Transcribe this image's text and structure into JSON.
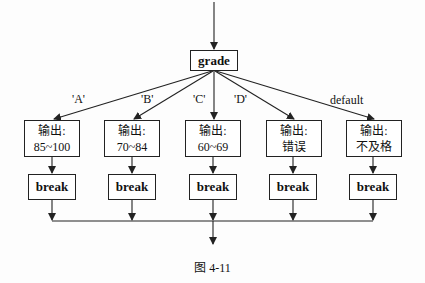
{
  "diagram": {
    "switch_node": "grade",
    "cases": [
      {
        "label": "'A'",
        "output_prefix": "输出:",
        "output_value": "85~100",
        "action": "break"
      },
      {
        "label": "'B'",
        "output_prefix": "输出:",
        "output_value": "70~84",
        "action": "break"
      },
      {
        "label": "'C'",
        "output_prefix": "输出:",
        "output_value": "60~69",
        "action": "break"
      },
      {
        "label": "'D'",
        "output_prefix": "输出:",
        "output_value": "错误",
        "action": "break"
      },
      {
        "label": "default",
        "output_prefix": "输出:",
        "output_value": "不及格",
        "action": "break"
      }
    ],
    "caption": "图 4-11"
  }
}
